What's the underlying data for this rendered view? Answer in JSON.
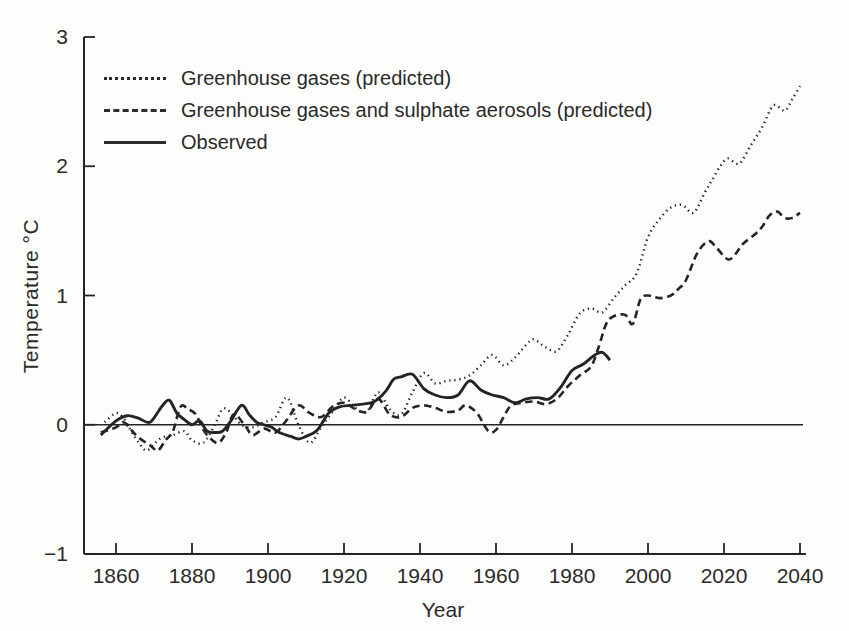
{
  "figure": {
    "background": "#fdfdfc",
    "ink_color": "#242424",
    "width": 849,
    "height": 631
  },
  "chart_data": {
    "type": "line",
    "title": "",
    "xlabel": "Year",
    "ylabel": "Temperature °C",
    "xlim": [
      1851,
      2041
    ],
    "ylim": [
      -1,
      3
    ],
    "x_ticks": [
      1860,
      1880,
      1900,
      1920,
      1940,
      1960,
      1980,
      2000,
      2020,
      2040
    ],
    "y_ticks": [
      3,
      2,
      1,
      0,
      -1
    ],
    "grid": false,
    "zero_line": true,
    "legend_position": "top-left-inside",
    "series": [
      {
        "name": "Greenhouse gases (predicted)",
        "style": "dotted",
        "points": [
          [
            1857,
            0.02
          ],
          [
            1860,
            0.09
          ],
          [
            1862,
            0.05
          ],
          [
            1864,
            -0.05
          ],
          [
            1866,
            -0.14
          ],
          [
            1868,
            -0.2
          ],
          [
            1870,
            -0.15
          ],
          [
            1872,
            -0.1
          ],
          [
            1875,
            -0.08
          ],
          [
            1878,
            -0.05
          ],
          [
            1880,
            -0.12
          ],
          [
            1883,
            -0.14
          ],
          [
            1886,
            0.0
          ],
          [
            1888,
            0.12
          ],
          [
            1890,
            0.1
          ],
          [
            1893,
            0.0
          ],
          [
            1896,
            -0.02
          ],
          [
            1899,
            0.02
          ],
          [
            1902,
            0.06
          ],
          [
            1905,
            0.21
          ],
          [
            1908,
            0.0
          ],
          [
            1911,
            -0.14
          ],
          [
            1914,
            -0.02
          ],
          [
            1917,
            0.1
          ],
          [
            1920,
            0.21
          ],
          [
            1923,
            0.13
          ],
          [
            1926,
            0.1
          ],
          [
            1929,
            0.25
          ],
          [
            1932,
            0.12
          ],
          [
            1935,
            0.08
          ],
          [
            1938,
            0.25
          ],
          [
            1941,
            0.4
          ],
          [
            1944,
            0.32
          ],
          [
            1947,
            0.34
          ],
          [
            1950,
            0.35
          ],
          [
            1953,
            0.38
          ],
          [
            1956,
            0.46
          ],
          [
            1959,
            0.54
          ],
          [
            1962,
            0.46
          ],
          [
            1965,
            0.52
          ],
          [
            1968,
            0.62
          ],
          [
            1970,
            0.66
          ],
          [
            1973,
            0.6
          ],
          [
            1976,
            0.57
          ],
          [
            1979,
            0.7
          ],
          [
            1982,
            0.86
          ],
          [
            1985,
            0.9
          ],
          [
            1988,
            0.87
          ],
          [
            1991,
            0.98
          ],
          [
            1994,
            1.08
          ],
          [
            1997,
            1.17
          ],
          [
            2000,
            1.45
          ],
          [
            2003,
            1.59
          ],
          [
            2006,
            1.68
          ],
          [
            2009,
            1.7
          ],
          [
            2012,
            1.64
          ],
          [
            2015,
            1.8
          ],
          [
            2017,
            1.9
          ],
          [
            2019,
            2.0
          ],
          [
            2021,
            2.06
          ],
          [
            2024,
            2.02
          ],
          [
            2027,
            2.16
          ],
          [
            2030,
            2.3
          ],
          [
            2033,
            2.47
          ],
          [
            2036,
            2.43
          ],
          [
            2038,
            2.52
          ],
          [
            2040,
            2.62
          ]
        ]
      },
      {
        "name": "Greenhouse gases and sulphate aerosols (predicted)",
        "style": "dashed",
        "points": [
          [
            1856,
            -0.06
          ],
          [
            1860,
            -0.02
          ],
          [
            1862,
            0.02
          ],
          [
            1864,
            -0.04
          ],
          [
            1866,
            -0.1
          ],
          [
            1869,
            -0.16
          ],
          [
            1871,
            -0.2
          ],
          [
            1873,
            -0.12
          ],
          [
            1875,
            -0.05
          ],
          [
            1877,
            0.14
          ],
          [
            1879,
            0.12
          ],
          [
            1881,
            0.08
          ],
          [
            1883,
            -0.04
          ],
          [
            1885,
            -0.11
          ],
          [
            1887,
            -0.14
          ],
          [
            1889,
            -0.06
          ],
          [
            1891,
            0.08
          ],
          [
            1894,
            -0.01
          ],
          [
            1896,
            -0.08
          ],
          [
            1899,
            -0.03
          ],
          [
            1902,
            -0.06
          ],
          [
            1905,
            0.04
          ],
          [
            1908,
            0.15
          ],
          [
            1911,
            0.09
          ],
          [
            1914,
            0.06
          ],
          [
            1917,
            0.14
          ],
          [
            1920,
            0.17
          ],
          [
            1923,
            0.12
          ],
          [
            1926,
            0.1
          ],
          [
            1929,
            0.2
          ],
          [
            1932,
            0.08
          ],
          [
            1935,
            0.06
          ],
          [
            1938,
            0.13
          ],
          [
            1941,
            0.15
          ],
          [
            1944,
            0.13
          ],
          [
            1947,
            0.1
          ],
          [
            1950,
            0.11
          ],
          [
            1952,
            0.15
          ],
          [
            1955,
            0.09
          ],
          [
            1958,
            -0.05
          ],
          [
            1960,
            -0.04
          ],
          [
            1962,
            0.06
          ],
          [
            1964,
            0.15
          ],
          [
            1967,
            0.17
          ],
          [
            1970,
            0.18
          ],
          [
            1973,
            0.16
          ],
          [
            1976,
            0.2
          ],
          [
            1979,
            0.3
          ],
          [
            1982,
            0.38
          ],
          [
            1985,
            0.45
          ],
          [
            1987,
            0.6
          ],
          [
            1989,
            0.78
          ],
          [
            1991,
            0.84
          ],
          [
            1994,
            0.85
          ],
          [
            1996,
            0.78
          ],
          [
            1998,
            0.97
          ],
          [
            2000,
            1.0
          ],
          [
            2003,
            0.98
          ],
          [
            2006,
            1.0
          ],
          [
            2008,
            1.05
          ],
          [
            2010,
            1.12
          ],
          [
            2013,
            1.33
          ],
          [
            2016,
            1.42
          ],
          [
            2018,
            1.37
          ],
          [
            2021,
            1.28
          ],
          [
            2023,
            1.32
          ],
          [
            2025,
            1.4
          ],
          [
            2028,
            1.47
          ],
          [
            2030,
            1.53
          ],
          [
            2032,
            1.62
          ],
          [
            2034,
            1.65
          ],
          [
            2036,
            1.6
          ],
          [
            2038,
            1.6
          ],
          [
            2040,
            1.64
          ]
        ]
      },
      {
        "name": "Observed",
        "style": "solid",
        "points": [
          [
            1856,
            -0.08
          ],
          [
            1860,
            0.03
          ],
          [
            1863,
            0.07
          ],
          [
            1866,
            0.05
          ],
          [
            1869,
            0.02
          ],
          [
            1872,
            0.14
          ],
          [
            1874,
            0.19
          ],
          [
            1876,
            0.09
          ],
          [
            1878,
            0.04
          ],
          [
            1880,
            0.0
          ],
          [
            1882,
            0.03
          ],
          [
            1884,
            -0.05
          ],
          [
            1886,
            -0.06
          ],
          [
            1888,
            -0.05
          ],
          [
            1890,
            0.02
          ],
          [
            1893,
            0.15
          ],
          [
            1895,
            0.08
          ],
          [
            1897,
            0.02
          ],
          [
            1899,
            0.0
          ],
          [
            1901,
            -0.02
          ],
          [
            1903,
            -0.06
          ],
          [
            1906,
            -0.09
          ],
          [
            1908,
            -0.11
          ],
          [
            1910,
            -0.09
          ],
          [
            1913,
            -0.04
          ],
          [
            1916,
            0.09
          ],
          [
            1919,
            0.14
          ],
          [
            1922,
            0.15
          ],
          [
            1925,
            0.16
          ],
          [
            1928,
            0.18
          ],
          [
            1931,
            0.26
          ],
          [
            1933,
            0.35
          ],
          [
            1935,
            0.37
          ],
          [
            1938,
            0.39
          ],
          [
            1941,
            0.28
          ],
          [
            1944,
            0.23
          ],
          [
            1947,
            0.21
          ],
          [
            1950,
            0.23
          ],
          [
            1953,
            0.34
          ],
          [
            1956,
            0.27
          ],
          [
            1959,
            0.23
          ],
          [
            1962,
            0.21
          ],
          [
            1965,
            0.17
          ],
          [
            1968,
            0.2
          ],
          [
            1971,
            0.21
          ],
          [
            1974,
            0.2
          ],
          [
            1977,
            0.29
          ],
          [
            1980,
            0.42
          ],
          [
            1983,
            0.47
          ],
          [
            1986,
            0.54
          ],
          [
            1988,
            0.56
          ],
          [
            1990,
            0.5
          ]
        ]
      }
    ]
  }
}
